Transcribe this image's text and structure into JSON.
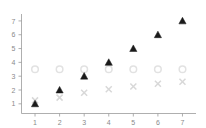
{
  "chart_data": {
    "type": "scatter",
    "title": "",
    "subtitle": "",
    "xlabel": "",
    "ylabel": "",
    "x": [
      1,
      2,
      3,
      4,
      5,
      6,
      7
    ],
    "xticks": [
      "1",
      "2",
      "3",
      "4",
      "5",
      "6",
      "7"
    ],
    "yticks": [
      "1",
      "2",
      "3",
      "4",
      "5",
      "6",
      "7"
    ],
    "xlim": [
      0.45,
      7.55
    ],
    "ylim": [
      0.3,
      7.5
    ],
    "grid": false,
    "legend": "none",
    "series": [
      {
        "name": "filled-triangle-series",
        "marker": "triangle-up-filled",
        "color": "#1a1a1a",
        "values": [
          1,
          2,
          3,
          4,
          5,
          6,
          7
        ]
      },
      {
        "name": "open-circle-series",
        "marker": "circle-open",
        "color": "#e2e2e2",
        "values": [
          3.5,
          3.5,
          3.5,
          3.5,
          3.5,
          3.5,
          3.5
        ]
      },
      {
        "name": "cross-series",
        "marker": "x-cross",
        "color": "#d8d8d8",
        "values": [
          1.25,
          1.45,
          1.8,
          2.05,
          2.25,
          2.45,
          2.6
        ]
      }
    ]
  },
  "axes": {
    "x_axis_name": "x-axis",
    "y_axis_name": "y-axis"
  }
}
